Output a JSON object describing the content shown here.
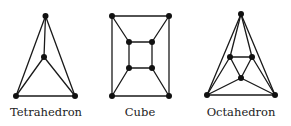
{
  "diagrams": [
    {
      "name": "Tetrahedron",
      "label": "Tetrahedron",
      "label_pos": [
        46,
        116
      ],
      "vertices": [
        [
          45.5,
          16
        ],
        [
          44,
          57
        ],
        [
          16,
          96
        ],
        [
          75,
          96
        ]
      ],
      "edges": [
        [
          0,
          1
        ],
        [
          0,
          2
        ],
        [
          0,
          3
        ],
        [
          1,
          2
        ],
        [
          1,
          3
        ],
        [
          2,
          3
        ]
      ]
    },
    {
      "name": "Cube",
      "label": "Cube",
      "label_pos": [
        140,
        116
      ],
      "vertices": [
        [
          112,
          16
        ],
        [
          169,
          16
        ],
        [
          112,
          96
        ],
        [
          169,
          96
        ],
        [
          129,
          42
        ],
        [
          152,
          42
        ],
        [
          129,
          68
        ],
        [
          152,
          68
        ]
      ],
      "edges": [
        [
          0,
          1
        ],
        [
          0,
          2
        ],
        [
          1,
          3
        ],
        [
          2,
          3
        ],
        [
          4,
          5
        ],
        [
          4,
          6
        ],
        [
          5,
          7
        ],
        [
          6,
          7
        ],
        [
          0,
          4
        ],
        [
          1,
          5
        ],
        [
          2,
          6
        ],
        [
          3,
          7
        ]
      ]
    },
    {
      "name": "Octahedron",
      "label": "Octahedron",
      "label_pos": [
        241,
        116
      ],
      "vertices": [
        [
          241,
          14
        ],
        [
          230,
          57
        ],
        [
          252,
          57
        ],
        [
          241,
          78
        ],
        [
          207,
          95
        ],
        [
          275,
          95
        ]
      ],
      "edges": [
        [
          0,
          4
        ],
        [
          0,
          5
        ],
        [
          0,
          1
        ],
        [
          0,
          2
        ],
        [
          1,
          2
        ],
        [
          1,
          3
        ],
        [
          2,
          3
        ],
        [
          1,
          4
        ],
        [
          2,
          5
        ],
        [
          3,
          4
        ],
        [
          3,
          5
        ],
        [
          4,
          5
        ]
      ]
    }
  ],
  "colors": {
    "edge": "#1a1a1a",
    "vertex": "#111111",
    "text": "#222222"
  }
}
